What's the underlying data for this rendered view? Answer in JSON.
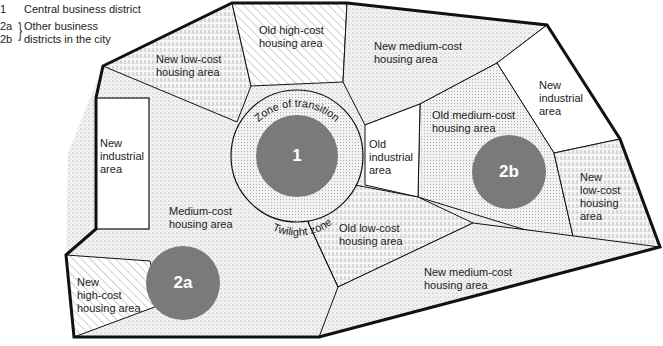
{
  "legend": {
    "items": [
      {
        "key": "1",
        "label": "Central business district"
      },
      {
        "key": "2a",
        "label": "Other business"
      },
      {
        "key": "2b",
        "label": "districts in the city"
      }
    ]
  },
  "zones": {
    "new_low_cost_nw": {
      "line1": "New low-cost",
      "line2": "housing area"
    },
    "old_high_cost": {
      "line1": "Old high-cost",
      "line2": "housing area"
    },
    "new_medium_cost_ne": {
      "line1": "New medium-cost",
      "line2": "housing area"
    },
    "new_industrial_west": {
      "line1": "New",
      "line2": "industrial",
      "line3": "area"
    },
    "new_industrial_east": {
      "line1": "New",
      "line2": "industrial",
      "line3": "area"
    },
    "old_industrial": {
      "line1": "Old",
      "line2": "industrial",
      "line3": "area"
    },
    "old_medium_cost": {
      "line1": "Old medium-cost",
      "line2": "housing area"
    },
    "new_low_cost_east": {
      "line1": "New",
      "line2": "low-cost",
      "line3": "housing",
      "line4": "area"
    },
    "medium_cost": {
      "line1": "Medium-cost",
      "line2": "housing area"
    },
    "old_low_cost": {
      "line1": "Old low-cost",
      "line2": "housing area"
    },
    "new_medium_cost_south": {
      "line1": "New medium-cost",
      "line2": "housing area"
    },
    "new_high_cost": {
      "line1": "New",
      "line2": "high-cost",
      "line3": "housing area"
    }
  },
  "ring": {
    "top_label": "Zone of transition",
    "bottom_label": "Twilight zone"
  },
  "districts": {
    "cbd": "1",
    "d2a": "2a",
    "d2b": "2b"
  },
  "colors": {
    "district_fill": "#7a7a7a",
    "outline": "#111111",
    "stipple": "#888888"
  }
}
